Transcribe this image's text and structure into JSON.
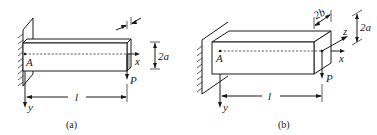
{
  "figure": {
    "panels": [
      {
        "id": "a",
        "caption": "(a)",
        "labels": {
          "point": "A",
          "x_axis": "x",
          "y_axis": "y",
          "load": "P",
          "length": "l",
          "height": "2a",
          "thickness": "l"
        }
      },
      {
        "id": "b",
        "caption": "(b)",
        "labels": {
          "point": "A",
          "x_axis": "x",
          "y_axis": "y",
          "z_axis": "z",
          "load": "P",
          "length": "l",
          "height": "2a",
          "width": "2b"
        }
      }
    ]
  }
}
